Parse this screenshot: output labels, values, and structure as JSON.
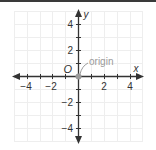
{
  "diagram": {
    "type": "coordinate-plane",
    "x_axis": {
      "label": "x",
      "ticks": [
        {
          "value": -4,
          "label": "−4"
        },
        {
          "value": -2,
          "label": "−2"
        },
        {
          "value": 2,
          "label": "2"
        },
        {
          "value": 4,
          "label": "4"
        }
      ],
      "range": [
        -5,
        5
      ]
    },
    "y_axis": {
      "label": "y",
      "ticks": [
        {
          "value": 4,
          "label": "4"
        },
        {
          "value": 2,
          "label": "2"
        },
        {
          "value": -2,
          "label": "−2"
        },
        {
          "value": -4,
          "label": "−4"
        }
      ],
      "range": [
        -5,
        5
      ]
    },
    "origin_label": "O",
    "annotation": "origin",
    "colors": {
      "axis": "#333333",
      "grid": "#eeeeee",
      "origin_point": "#9a9a9a",
      "annotation": "#9a9a9a",
      "top_bar": "#3a3a3a"
    }
  }
}
